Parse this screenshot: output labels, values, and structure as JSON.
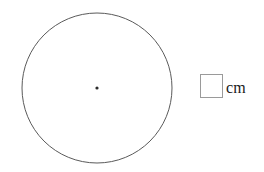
{
  "figure": {
    "type": "circle-with-center-dot",
    "background_color": "#ffffff",
    "circle": {
      "name": "circle-outline",
      "center_x": 97,
      "center_y": 88,
      "radius": 75,
      "stroke_color": "#5a5a5a",
      "stroke_width": 1,
      "fill": "none"
    },
    "center_point": {
      "name": "center-dot",
      "x": 97,
      "y": 88,
      "radius": 1.6,
      "color": "#2b2b2b"
    }
  },
  "answer": {
    "box_value": "",
    "box_placeholder": "",
    "unit_label": "cm",
    "box_border_color": "#9a9a9a"
  }
}
